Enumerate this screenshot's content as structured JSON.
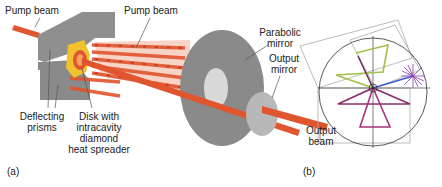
{
  "figure": {
    "panels": [
      {
        "tag": "(a)",
        "labels": {
          "pump_beam_1": "Pump beam",
          "pump_beam_2": "Pump beam",
          "parabolic_mirror_1": "Parabolic",
          "parabolic_mirror_2": "mirror",
          "output_mirror_1": "Output",
          "output_mirror_2": "mirror",
          "deflecting_prisms_1": "Deflecting",
          "deflecting_prisms_2": "prisms",
          "disk_1": "Disk with",
          "disk_2": "intracavity",
          "disk_3": "diamond",
          "disk_4": "heat spreader",
          "output_beam_1": "Output",
          "output_beam_2": "beam"
        }
      },
      {
        "tag": "(b)"
      }
    ],
    "colors": {
      "background": "#ffffff",
      "prism_gray": "#8c8c8c",
      "mirror_gray": "#8a8a8a",
      "mirror_light": "#b5b5b5",
      "beam_orange": "#e0542e",
      "beam_pale": "#f2b49e",
      "disk_yellow": "#f2c12e",
      "line_dark": "#333333",
      "line_light": "#aaaaaa",
      "green": "#9fc04a",
      "purple": "#8a2f6a",
      "magenta": "#a8327a",
      "violet": "#7a4aa8",
      "blue": "#3a5bd0"
    }
  }
}
